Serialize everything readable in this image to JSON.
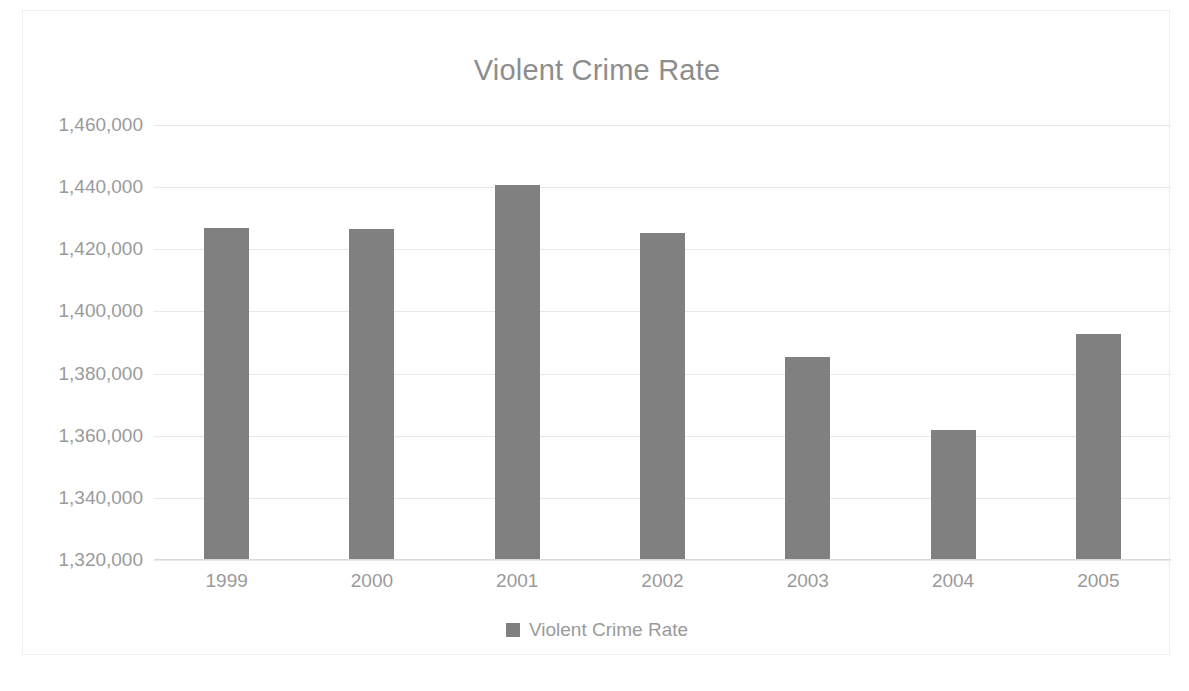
{
  "chart": {
    "title": "Violent Crime Rate",
    "legend_label": "Violent Crime Rate",
    "bar_color": "#808080",
    "text_color": "#9a9a9a",
    "title_color": "#8d8d8d",
    "gridline_color": "#e8e8e8"
  },
  "chart_data": {
    "type": "bar",
    "title": "Violent Crime Rate",
    "xlabel": "",
    "ylabel": "",
    "categories": [
      "1999",
      "2000",
      "2001",
      "2002",
      "2003",
      "2004",
      "2005"
    ],
    "series": [
      {
        "name": "Violent Crime Rate",
        "values": [
          1426600,
          1426300,
          1440400,
          1425000,
          1385000,
          1361500,
          1392500
        ]
      }
    ],
    "values": [
      1426600,
      1426300,
      1440400,
      1425000,
      1385000,
      1361500,
      1392500
    ],
    "ylim": [
      1320000,
      1460000
    ],
    "ytick_values": [
      1460000,
      1440000,
      1420000,
      1400000,
      1380000,
      1360000,
      1340000,
      1320000
    ],
    "ytick_labels": [
      "1,460,000",
      "1,440,000",
      "1,420,000",
      "1,400,000",
      "1,380,000",
      "1,360,000",
      "1,340,000",
      "1,320,000"
    ],
    "grid": true,
    "grid_axis": "y",
    "legend": [
      "Violent Crime Rate"
    ],
    "legend_position": "bottom"
  }
}
